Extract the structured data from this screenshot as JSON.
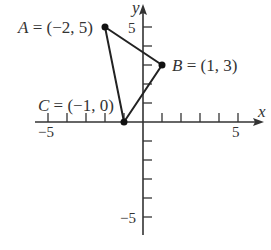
{
  "diagram": {
    "type": "coordinate-plane-triangle",
    "axes": {
      "x_label": "x",
      "y_label": "y",
      "x_tick_labels": {
        "neg": "−5",
        "pos": "5"
      },
      "y_tick_labels": {
        "neg": "−5",
        "pos": "5"
      },
      "x_range": [
        -6,
        6
      ],
      "y_range": [
        -6,
        6
      ]
    },
    "points": [
      {
        "name": "A",
        "x": -2,
        "y": 5,
        "label": "A = (−2, 5)"
      },
      {
        "name": "B",
        "x": 1,
        "y": 3,
        "label": "B = (1, 3)"
      },
      {
        "name": "C",
        "x": -1,
        "y": 0,
        "label": "C = (−1, 0)"
      }
    ],
    "edges": [
      [
        "A",
        "B"
      ],
      [
        "B",
        "C"
      ],
      [
        "C",
        "A"
      ]
    ],
    "colors": {
      "stroke": "#222222",
      "text": "#333333"
    }
  }
}
